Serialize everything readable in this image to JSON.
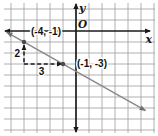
{
  "figure": {
    "type": "coordinate-plane line graph",
    "x_axis_label": "x",
    "y_axis_label": "y",
    "origin_label": "O",
    "rise_label": "2",
    "run_label": "3"
  },
  "colors": {
    "grid": "#9c9c9c",
    "axis": "#1a1a1a",
    "line": "#8a8a8a",
    "line_arrow": "#707070",
    "point": "#4a4a4a",
    "dashed": "#1a1a1a",
    "text": "#111111",
    "background": "#ffffff"
  },
  "chart_data": {
    "type": "line",
    "title": "",
    "points": [
      {
        "x": -4,
        "y": -1
      },
      {
        "x": -1,
        "y": -3
      }
    ],
    "point_labels": [
      "(-4, -1)",
      "(-1, -3)"
    ],
    "slope": {
      "rise": -2,
      "run": 3,
      "value": -0.6667
    },
    "rise_annotation": "2",
    "run_annotation": "3",
    "xlabel": "x",
    "ylabel": "y",
    "origin": "O",
    "grid_on": true,
    "grid": {
      "x_min": -5,
      "x_max": 6,
      "y_min": -9,
      "y_max": 2
    },
    "legend": "none"
  }
}
